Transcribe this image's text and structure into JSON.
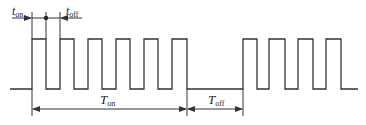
{
  "diagram": {
    "type": "pulse-train timing diagram",
    "stroke_color": "#333333",
    "labels": {
      "t_on": {
        "main": "t",
        "sub": "on"
      },
      "t_off": {
        "main": "t",
        "sub": "off"
      },
      "T_on": {
        "main": "T",
        "sub": "on"
      },
      "T_off": {
        "main": "T",
        "sub": "off"
      }
    },
    "bursts": [
      {
        "name": "on-period-burst-1",
        "pulses": 6
      },
      {
        "name": "on-period-burst-2",
        "pulses": 4
      }
    ]
  }
}
